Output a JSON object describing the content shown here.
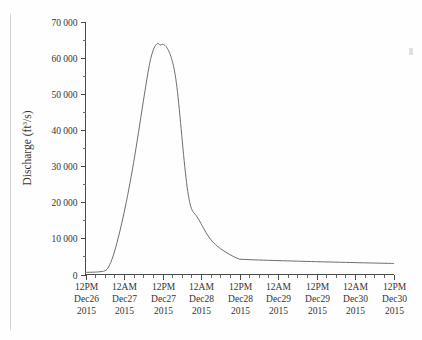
{
  "chart_data": {
    "type": "line",
    "title": "",
    "xlabel": "",
    "ylabel": "Discharge (ft3/s)",
    "ylabel_prefix": "Discharge (ft",
    "ylabel_superscript": "3",
    "ylabel_suffix": "/s)",
    "ylim": [
      0,
      70000
    ],
    "yticks": [
      0,
      10000,
      20000,
      30000,
      40000,
      50000,
      60000,
      70000
    ],
    "ytick_labels": [
      "0",
      "10 000",
      "20 000",
      "30 000",
      "40 000",
      "50 000",
      "60 000",
      "70 000"
    ],
    "y_minor_ticks_between": 1,
    "x_minor_ticks_between": 3,
    "grid": false,
    "legend": false,
    "line_color": "#6e6e6e",
    "axis_color": "#4a4a4a",
    "xtick_labels": [
      {
        "time": "12PM",
        "date": "Dec26",
        "year": "2015"
      },
      {
        "time": "12AM",
        "date": "Dec27",
        "year": "2015"
      },
      {
        "time": "12PM",
        "date": "Dec27",
        "year": "2015"
      },
      {
        "time": "12AM",
        "date": "Dec28",
        "year": "2015"
      },
      {
        "time": "12PM",
        "date": "Dec28",
        "year": "2015"
      },
      {
        "time": "12AM",
        "date": "Dec29",
        "year": "2015"
      },
      {
        "time": "12PM",
        "date": "Dec29",
        "year": "2015"
      },
      {
        "time": "12AM",
        "date": "Dec30",
        "year": "2015"
      },
      {
        "time": "12PM",
        "date": "Dec30",
        "year": "2015"
      }
    ],
    "x": [
      0,
      0.25,
      0.5,
      0.75,
      1,
      1.25,
      1.5,
      1.75,
      2,
      2.25,
      2.5,
      2.75,
      3,
      3.25,
      3.5,
      3.75,
      4,
      4.25,
      4.5,
      4.75,
      5,
      5.25,
      5.5,
      5.75,
      6,
      6.25,
      6.5,
      6.75,
      7,
      7.25,
      7.5,
      7.75,
      8,
      8.25,
      8.5,
      8.75,
      9,
      9.25,
      9.5,
      9.75,
      10,
      10.25,
      10.5,
      10.75,
      11,
      11.25,
      11.5,
      11.75,
      12,
      12.5,
      13,
      13.5,
      14,
      14.5,
      15,
      15.5,
      16
    ],
    "x_unit": "6-hour steps from 12PM Dec26 2015",
    "values": [
      600,
      600,
      620,
      640,
      660,
      700,
      760,
      850,
      1000,
      1500,
      2600,
      4200,
      6200,
      8600,
      11200,
      14000,
      17000,
      20200,
      23600,
      27200,
      31000,
      35000,
      39200,
      43500,
      47800,
      52000,
      56000,
      59400,
      61800,
      63300,
      63900,
      63500,
      63700,
      63400,
      62600,
      61200,
      59200,
      56300,
      51800,
      45600,
      38500,
      31500,
      25400,
      21000,
      18300,
      17100,
      16300,
      15300,
      14100,
      11700,
      9700,
      8300,
      7200,
      6300,
      5500,
      4800,
      4250
    ],
    "values_tail": {
      "note": "long recession continues to about 3 000 ft3/s at the right edge",
      "end_value": 3050
    },
    "peak": {
      "value": 64000,
      "label": "",
      "at": "12AM Dec28 2015"
    },
    "baseflow": 600
  }
}
